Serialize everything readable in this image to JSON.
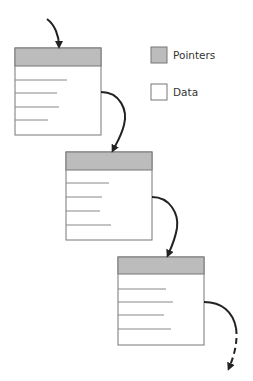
{
  "colors": {
    "pointer_fill": "#bcbcbc",
    "data_fill": "#ffffff",
    "border": "#777777",
    "data_line": "#888888",
    "arrow": "#222222"
  },
  "legend": {
    "items": [
      {
        "label": "Pointers",
        "swatch": "pointer"
      },
      {
        "label": "Data",
        "swatch": "data"
      }
    ]
  },
  "nodes": [
    {
      "x": 15,
      "y": 48,
      "w": 86,
      "h": 87,
      "header_h": 18,
      "lines": [
        52,
        42,
        44,
        33
      ],
      "line_ys": [
        80,
        93,
        107,
        120
      ]
    },
    {
      "x": 66,
      "y": 152,
      "w": 86,
      "h": 88,
      "header_h": 18,
      "lines": [
        43,
        36,
        34,
        45
      ],
      "line_ys": [
        183,
        197,
        211,
        225
      ]
    },
    {
      "x": 118,
      "y": 257,
      "w": 86,
      "h": 88,
      "header_h": 17,
      "lines": [
        48,
        55,
        46,
        53
      ],
      "line_ys": [
        289,
        302,
        315,
        329
      ]
    }
  ]
}
